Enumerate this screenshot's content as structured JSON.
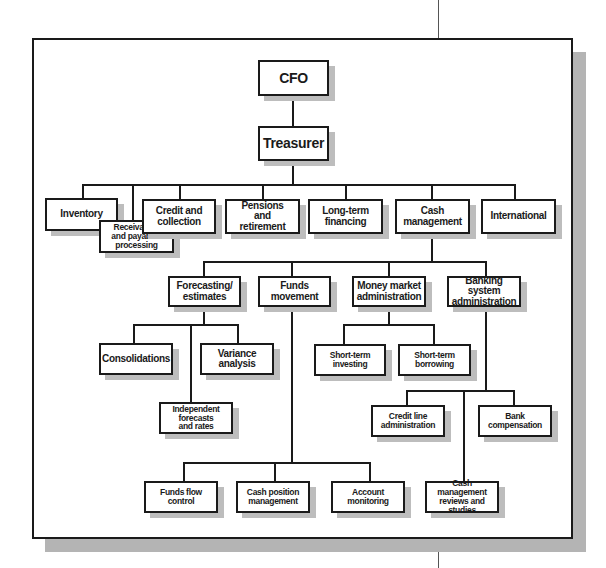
{
  "diagram": {
    "type": "org-chart",
    "colors": {
      "line": "#1a1a1a",
      "box_fill": "#ffffff",
      "shadow": "#b4b4b4"
    },
    "nodes": {
      "cfo": "CFO",
      "treasurer": "Treasurer",
      "inventory": "Inventory",
      "receivables": "Receivables and payables processing",
      "credit": "Credit and collection",
      "pensions": "Pensions and retirement",
      "longterm": "Long-term financing",
      "cash_management": "Cash management",
      "international": "International",
      "forecasting": "Forecasting/ estimates",
      "funds_movement": "Funds movement",
      "money_market": "Money market administration",
      "banking_system": "Banking system administration",
      "consolidations": "Consolidations",
      "variance": "Variance analysis",
      "independent": "Independent forecasts and rates",
      "st_investing": "Short-term investing",
      "st_borrowing": "Short-term borrowing",
      "credit_line": "Credit line administration",
      "bank_comp": "Bank compensation",
      "cm_reviews": "Cash management reviews and studies",
      "funds_flow": "Funds flow control",
      "cash_position": "Cash position management",
      "account_monitoring": "Account monitoring"
    },
    "edges": [
      [
        "CFO",
        "Treasurer"
      ],
      [
        "Treasurer",
        "Inventory"
      ],
      [
        "Treasurer",
        "Receivables and payables processing"
      ],
      [
        "Treasurer",
        "Credit and collection"
      ],
      [
        "Treasurer",
        "Pensions and retirement"
      ],
      [
        "Treasurer",
        "Long-term financing"
      ],
      [
        "Treasurer",
        "Cash management"
      ],
      [
        "Treasurer",
        "International"
      ],
      [
        "Cash management",
        "Forecasting/ estimates"
      ],
      [
        "Cash management",
        "Funds movement"
      ],
      [
        "Cash management",
        "Money market administration"
      ],
      [
        "Cash management",
        "Banking system administration"
      ],
      [
        "Forecasting/ estimates",
        "Consolidations"
      ],
      [
        "Forecasting/ estimates",
        "Variance analysis"
      ],
      [
        "Forecasting/ estimates",
        "Independent forecasts and rates"
      ],
      [
        "Funds movement",
        "Funds flow control"
      ],
      [
        "Funds movement",
        "Cash position management"
      ],
      [
        "Funds movement",
        "Account monitoring"
      ],
      [
        "Money market administration",
        "Short-term investing"
      ],
      [
        "Money market administration",
        "Short-term borrowing"
      ],
      [
        "Banking system administration",
        "Credit line administration"
      ],
      [
        "Banking system administration",
        "Bank compensation"
      ],
      [
        "Banking system administration",
        "Cash management reviews and studies"
      ]
    ]
  }
}
